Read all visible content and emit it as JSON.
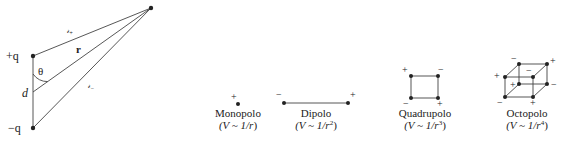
{
  "dipole_geometry": {
    "plus_charge": "+q",
    "minus_charge": "−q",
    "separation": "d",
    "angle": "θ",
    "r_vector": "r",
    "r_plus": "𝓇",
    "r_plus_sub": "+",
    "r_minus": "𝓇",
    "r_minus_sub": "−"
  },
  "multipoles": [
    {
      "name": "Monopolo",
      "formula_prefix": "(V ~ 1/r",
      "formula_exp": "",
      "formula_suffix": ")",
      "charges": [
        "+"
      ]
    },
    {
      "name": "Dipolo",
      "formula_prefix": "(V ~ 1/r",
      "formula_exp": "2",
      "formula_suffix": ")",
      "charges": [
        "−",
        "+"
      ]
    },
    {
      "name": "Quadrupolo",
      "formula_prefix": "(V ~ 1/r",
      "formula_exp": "3",
      "formula_suffix": ")",
      "charges": [
        "+",
        "−",
        "−",
        "+"
      ]
    },
    {
      "name": "Octopolo",
      "formula_prefix": "(V ~ 1/r",
      "formula_exp": "4",
      "formula_suffix": ")",
      "charges": [
        "−",
        "+",
        "+",
        "−",
        "+",
        "−",
        "−",
        "+"
      ]
    }
  ],
  "colors": {
    "ink": "#222222",
    "line": "#444444",
    "background": "#ffffff"
  }
}
